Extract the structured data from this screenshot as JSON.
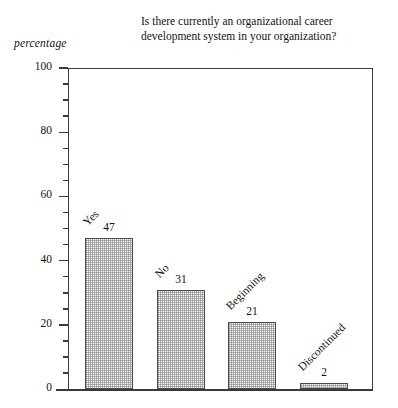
{
  "chart_data": {
    "type": "bar",
    "title": "Is there currently an organizational career\ndevelopment system in your organization?",
    "xlabel": "",
    "ylabel": "percentage",
    "ylim": [
      0,
      100
    ],
    "grid": false,
    "legend": "none",
    "categories": [
      "Yes",
      "No",
      "Beginning",
      "Discontinued"
    ],
    "values": [
      47,
      31,
      21,
      2
    ],
    "value_labels": [
      "47",
      "31",
      "21",
      "2"
    ],
    "y_ticks": [
      0,
      20,
      40,
      60,
      80,
      100
    ],
    "y_tick_labels": [
      "0",
      "20",
      "40",
      "60",
      "80",
      "100"
    ],
    "y_minor_tick_step": 5,
    "bar_fill": "#cccccc",
    "bar_edge": "#4a4a4a",
    "axis_color": "#3a3a3a",
    "background": "#ffffff"
  }
}
